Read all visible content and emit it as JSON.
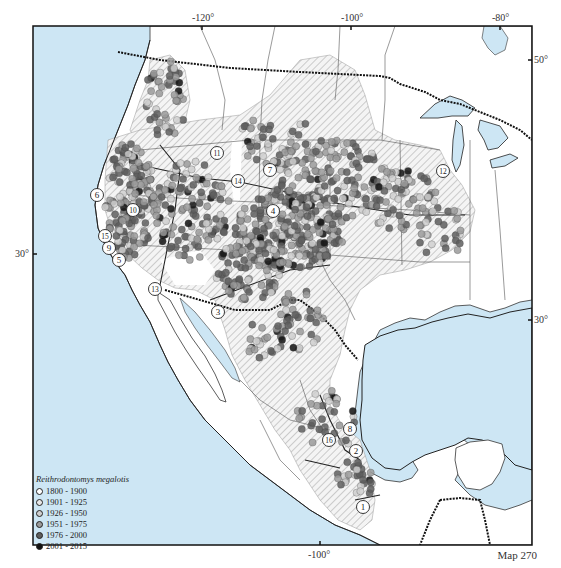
{
  "map": {
    "species": "Reithrodontomys megalotis",
    "map_label": "Map 270",
    "colors": {
      "water": "#cde6f4",
      "land": "#ffffff",
      "range_hatch": "#b8b8b8",
      "frame": "#111111"
    },
    "axes": {
      "top_ticks": [
        "-120°",
        "-100°",
        "-80°"
      ],
      "bottom_ticks": [
        "-100°"
      ],
      "left_ticks": [
        "30°"
      ],
      "right_ticks": [
        "50°",
        "30°"
      ]
    },
    "legend": {
      "title": "Reithrodontomys megalotis",
      "entries": [
        {
          "label": "1800 - 1900",
          "fill": "#ffffff"
        },
        {
          "label": "1901 - 1925",
          "fill": "#e8e8e8"
        },
        {
          "label": "1926 - 1950",
          "fill": "#cfcfcf"
        },
        {
          "label": "1951 - 1975",
          "fill": "#9a9a9a"
        },
        {
          "label": "1976 - 2000",
          "fill": "#5e5e5e"
        },
        {
          "label": "2001 - 2015",
          "fill": "#111111"
        }
      ]
    },
    "subspecies_markers": [
      {
        "n": "1",
        "x": 363,
        "y": 507
      },
      {
        "n": "2",
        "x": 356,
        "y": 451
      },
      {
        "n": "3",
        "x": 218,
        "y": 312
      },
      {
        "n": "4",
        "x": 273,
        "y": 211
      },
      {
        "n": "5",
        "x": 119,
        "y": 260
      },
      {
        "n": "6",
        "x": 97,
        "y": 195
      },
      {
        "n": "7",
        "x": 270,
        "y": 170
      },
      {
        "n": "8",
        "x": 350,
        "y": 429
      },
      {
        "n": "9",
        "x": 109,
        "y": 248
      },
      {
        "n": "10",
        "x": 133,
        "y": 210
      },
      {
        "n": "11",
        "x": 217,
        "y": 153
      },
      {
        "n": "12",
        "x": 443,
        "y": 171
      },
      {
        "n": "13",
        "x": 155,
        "y": 289
      },
      {
        "n": "14",
        "x": 238,
        "y": 181
      },
      {
        "n": "15",
        "x": 105,
        "y": 236
      },
      {
        "n": "16",
        "x": 329,
        "y": 440
      }
    ]
  }
}
